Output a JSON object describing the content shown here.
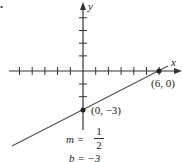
{
  "diagram": {
    "type": "line-graph",
    "x_axis_label": "x",
    "y_axis_label": "y",
    "points": [
      {
        "label": "(0, −3)",
        "x": 0,
        "y": -3
      },
      {
        "label": "(6, 0)",
        "x": 6,
        "y": 0
      }
    ],
    "slope_label": "m =",
    "slope_numerator": "1",
    "slope_denominator": "2",
    "intercept_label": "b = −3",
    "corner_mark": "."
  }
}
